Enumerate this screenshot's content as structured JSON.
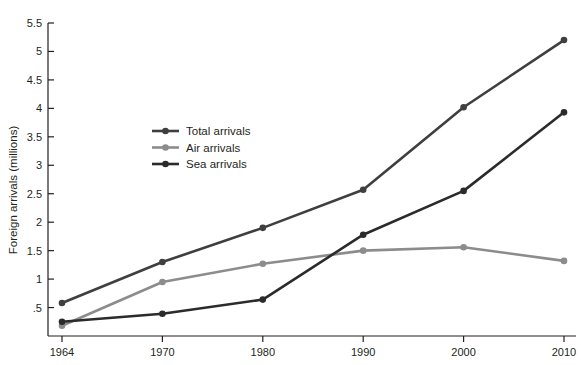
{
  "chart_data": {
    "type": "line",
    "title": "",
    "xlabel": "",
    "ylabel": "Foreign arrivals (millions)",
    "categories": [
      "1964",
      "1970",
      "1980",
      "1990",
      "2000",
      "2010"
    ],
    "x": [
      1964,
      1970,
      1980,
      1990,
      2000,
      2010
    ],
    "xaxis_type": "categorical",
    "ylim": [
      0,
      5.5
    ],
    "ytick_values": [
      0.5,
      1,
      1.5,
      2,
      2.5,
      3,
      3.5,
      4,
      4.5,
      5,
      5.5
    ],
    "ytick_labels": [
      ".5",
      "1",
      "1.5",
      "2",
      "2.5",
      "3",
      "3.5",
      "4",
      "4.5",
      "5",
      "5.5"
    ],
    "grid": false,
    "legend_position": "inside-upper-left",
    "markers": "filled-circle",
    "series": [
      {
        "name": "Total arrivals",
        "color": "#3f3f3f",
        "values": [
          0.58,
          1.3,
          1.9,
          2.57,
          4.02,
          5.2
        ]
      },
      {
        "name": "Air arrivals",
        "color": "#8c8c8c",
        "values": [
          0.18,
          0.95,
          1.27,
          1.5,
          1.56,
          1.32
        ]
      },
      {
        "name": "Sea arrivals",
        "color": "#2b2b2b",
        "values": [
          0.25,
          0.39,
          0.64,
          1.78,
          2.55,
          3.93
        ]
      }
    ]
  },
  "legend": {
    "items": [
      {
        "label": "Total arrivals"
      },
      {
        "label": "Air arrivals"
      },
      {
        "label": "Sea arrivals"
      }
    ]
  },
  "axes": {
    "y_title": "Foreign arrivals (millions)"
  }
}
